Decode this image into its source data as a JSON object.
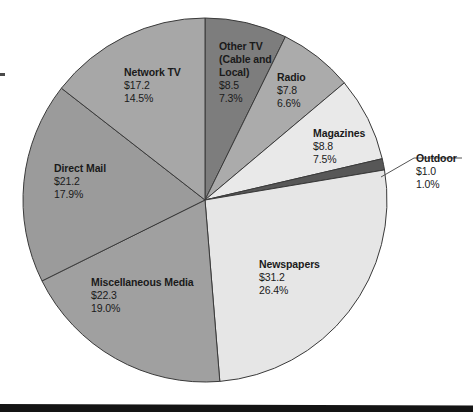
{
  "chart_data": {
    "type": "pie",
    "title": "",
    "subtitle": "",
    "xlabel": "",
    "ylabel": "",
    "legend_position": "none",
    "grid": false,
    "value_prefix": "$",
    "total_percent": "100.0%",
    "slices": [
      {
        "id": "other-tv",
        "label": "Other TV\n(Cable and\nLocal)",
        "label_flat": "Other TV (Cable and Local)",
        "value_text": "$8.5",
        "value": 8.5,
        "percent_text": "7.3%",
        "percent": 7.3,
        "color": "#7d7d7d",
        "multiline": true
      },
      {
        "id": "radio",
        "label": "Radio",
        "label_flat": "Radio",
        "value_text": "$7.8",
        "value": 7.8,
        "percent_text": "6.6%",
        "percent": 6.6,
        "color": "#ababab",
        "multiline": false
      },
      {
        "id": "magazines",
        "label": "Magazines",
        "label_flat": "Magazines",
        "value_text": "$8.8",
        "value": 8.8,
        "percent_text": "7.5%",
        "percent": 7.5,
        "color": "#e9e9e9",
        "multiline": false
      },
      {
        "id": "outdoor",
        "label": "Outdoor",
        "label_flat": "Outdoor",
        "value_text": "$1.0",
        "value": 1.0,
        "percent_text": "1.0%",
        "percent": 1.0,
        "color": "#575757",
        "multiline": false
      },
      {
        "id": "newspapers",
        "label": "Newspapers",
        "label_flat": "Newspapers",
        "value_text": "$31.2",
        "value": 31.2,
        "percent_text": "26.4%",
        "percent": 26.4,
        "color": "#e6e6e6",
        "multiline": false
      },
      {
        "id": "misc-media",
        "label": "Miscellaneous Media",
        "label_flat": "Miscellaneous Media",
        "value_text": "$22.3",
        "value": 22.3,
        "percent_text": "19.0%",
        "percent": 19.0,
        "color": "#a0a0a0",
        "multiline": false
      },
      {
        "id": "direct-mail",
        "label": "Direct Mail",
        "label_flat": "Direct Mail",
        "value_text": "$21.2",
        "value": 21.2,
        "percent_text": "17.9%",
        "percent": 17.9,
        "color": "#9b9b9b",
        "multiline": false
      },
      {
        "id": "network-tv",
        "label": "Network TV",
        "label_flat": "Network TV",
        "value_text": "$17.2",
        "value": 17.2,
        "percent_text": "14.5%",
        "percent": 14.5,
        "color": "#a7a7a7",
        "multiline": false
      }
    ]
  },
  "colors": {
    "text": "#1a1a1a",
    "outline": "#3a3a3a",
    "background": "#ffffff",
    "rule": "#141414",
    "leader_line": "#555555"
  }
}
